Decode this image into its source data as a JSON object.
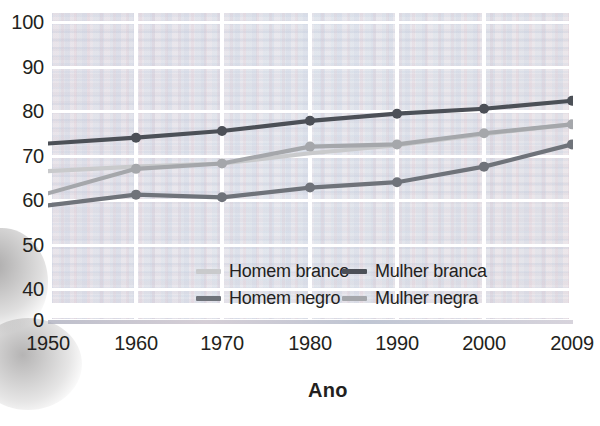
{
  "chart_data": {
    "type": "line",
    "title": "",
    "xlabel": "Ano",
    "ylabel": "",
    "x": [
      1950,
      1960,
      1970,
      1980,
      1990,
      2000,
      2009
    ],
    "xtick_labels": [
      "1950",
      "1960",
      "1970",
      "1980",
      "1990",
      "2000",
      "2009"
    ],
    "ytick_labels": [
      "100",
      "90",
      "80",
      "70",
      "60",
      "50",
      "40",
      "0"
    ],
    "ytick_values": [
      100,
      90,
      80,
      70,
      60,
      50,
      40,
      0
    ],
    "ylim": [
      40,
      100
    ],
    "axis_break": true,
    "axis_break_note": "Eixo y interrompido entre 0 e 40",
    "grid": true,
    "legend_position": "inside-bottom-center",
    "series": [
      {
        "name": "Homem branco",
        "color": "#c9cacc",
        "values": [
          66.5,
          67.5,
          68.2,
          70.5,
          72.3,
          74.8,
          77.0
        ],
        "markers": false
      },
      {
        "name": "Mulher branca",
        "color": "#4c5057",
        "values": [
          72.7,
          74.0,
          75.5,
          77.8,
          79.4,
          80.5,
          82.3
        ],
        "markers": true
      },
      {
        "name": "Homem negro",
        "color": "#6f737a",
        "values": [
          58.8,
          61.2,
          60.6,
          62.8,
          64.0,
          67.5,
          72.5
        ],
        "markers": true
      },
      {
        "name": "Mulher negra",
        "color": "#a5a7ab",
        "values": [
          61.5,
          67.0,
          68.2,
          72.0,
          72.5,
          75.0,
          77.0
        ],
        "markers": true
      }
    ]
  },
  "axis": {
    "x_title": "Ano"
  },
  "legend": {
    "entries": [
      {
        "label": "Homem branco",
        "color": "#c9cacc"
      },
      {
        "label": "Mulher branca",
        "color": "#4c5057"
      },
      {
        "label": "Homem negro",
        "color": "#6f737a"
      },
      {
        "label": "Mulher negra",
        "color": "#a5a7ab"
      }
    ]
  }
}
